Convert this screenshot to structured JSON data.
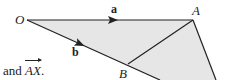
{
  "diagram": {
    "type": "vector-geometry",
    "fill_color": "#e6e6e6",
    "line_color": "#222222",
    "points": {
      "O": {
        "label": "O",
        "x": 27,
        "y": 20
      },
      "A": {
        "label": "A",
        "x": 193,
        "y": 20
      },
      "B": {
        "label": "B",
        "x": 128,
        "y": 64
      }
    },
    "vectors": [
      {
        "label": "a",
        "from": "O",
        "to": "A"
      },
      {
        "label": "b",
        "from": "O",
        "to": "B"
      }
    ],
    "segments": [
      [
        "O",
        "A"
      ],
      [
        "O",
        "B"
      ],
      [
        "A",
        "B"
      ]
    ]
  },
  "caption": {
    "prefix": "and ",
    "vector": "AX",
    "suffix": "."
  }
}
